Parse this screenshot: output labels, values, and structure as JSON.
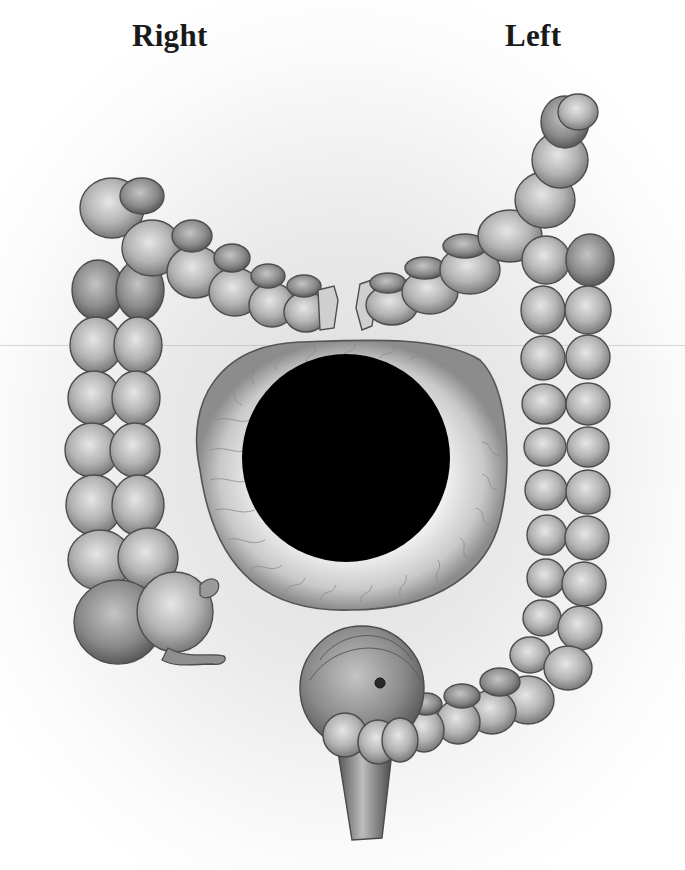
{
  "figure": {
    "labels": {
      "right": "Right",
      "left": "Left"
    },
    "parts": [
      "ascending-colon",
      "hepatic-flexure",
      "transverse-colon-right",
      "transverse-colon-left",
      "splenic-flexure",
      "descending-colon",
      "cecum",
      "appendix",
      "lumen-cross-section",
      "sigmoid-colon",
      "rectum"
    ],
    "colors": {
      "background": "#ffffff",
      "tissue_light": "#d8d8d8",
      "tissue_mid": "#9a9a9a",
      "tissue_dark": "#555555",
      "lumen": "#000000",
      "label_text": "#1a1a1a"
    }
  }
}
